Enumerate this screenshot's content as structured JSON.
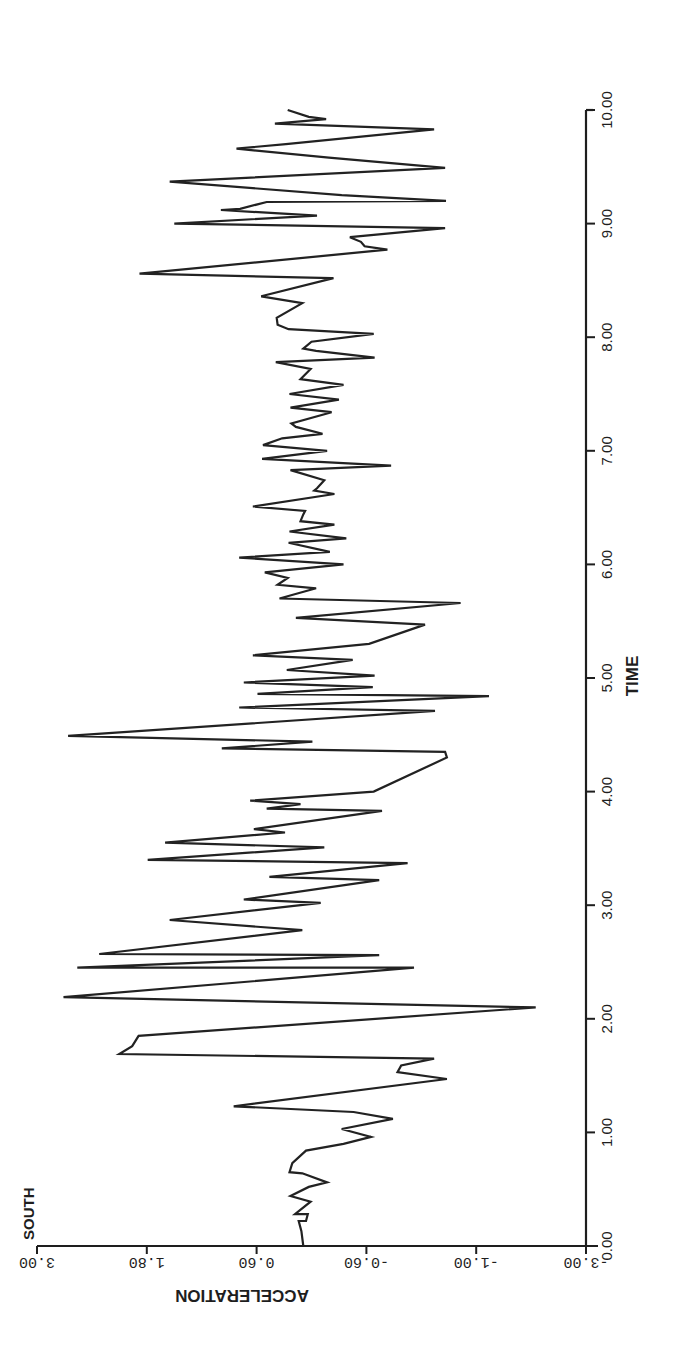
{
  "chart_data": {
    "type": "line",
    "title": "",
    "series_label": "SOUTH",
    "xlabel": "TIME",
    "ylabel": "ACCELERATION",
    "xlim": [
      0,
      10
    ],
    "ylim": [
      -3,
      3
    ],
    "x_ticks": [
      "0.00",
      "1.00",
      "2.00",
      "3.00",
      "4.00",
      "5.00",
      "6.00",
      "7.00",
      "8.00",
      "9.00",
      "10.00"
    ],
    "y_ticks": [
      "3.00",
      "1.80",
      "0.60",
      "-0.60",
      "-1.00",
      "-3.00"
    ],
    "y_tick_positions": [
      3.0,
      1.8,
      0.6,
      -0.6,
      -1.8,
      -3.0
    ],
    "grid": false,
    "legend": "none",
    "orientation_note": "figure printed rotated 90 degrees; time axis vertical on right, acceleration axis horizontal at bottom",
    "series": [
      {
        "name": "SOUTH",
        "color": "#222222",
        "points": [
          [
            0.0,
            0.09
          ],
          [
            0.13,
            0.11
          ],
          [
            0.22,
            0.14
          ],
          [
            0.22,
            0.06
          ],
          [
            0.28,
            0.04
          ],
          [
            0.28,
            0.18
          ],
          [
            0.39,
            0.01
          ],
          [
            0.44,
            0.23
          ],
          [
            0.52,
            0.03
          ],
          [
            0.56,
            -0.17
          ],
          [
            0.64,
            0.1
          ],
          [
            0.65,
            0.24
          ],
          [
            0.73,
            0.21
          ],
          [
            0.84,
            0.06
          ],
          [
            0.9,
            -0.35
          ],
          [
            0.96,
            -0.65
          ],
          [
            1.03,
            -0.33
          ],
          [
            1.12,
            -0.89
          ],
          [
            1.18,
            -0.46
          ],
          [
            1.23,
            0.85
          ],
          [
            1.47,
            -1.48
          ],
          [
            1.53,
            -0.94
          ],
          [
            1.59,
            -0.98
          ],
          [
            1.65,
            -1.34
          ],
          [
            1.69,
            2.1
          ],
          [
            1.76,
            1.96
          ],
          [
            1.85,
            1.89
          ],
          [
            2.1,
            -2.45
          ],
          [
            2.19,
            2.71
          ],
          [
            2.45,
            -1.12
          ],
          [
            2.45,
            2.56
          ],
          [
            2.56,
            -0.74
          ],
          [
            2.57,
            2.32
          ],
          [
            2.78,
            0.1
          ],
          [
            2.87,
            1.55
          ],
          [
            3.02,
            -0.1
          ],
          [
            3.05,
            0.74
          ],
          [
            3.22,
            -0.74
          ],
          [
            3.25,
            0.46
          ],
          [
            3.37,
            -1.05
          ],
          [
            3.4,
            1.79
          ],
          [
            3.51,
            -0.14
          ],
          [
            3.55,
            1.6
          ],
          [
            3.64,
            0.29
          ],
          [
            3.67,
            0.63
          ],
          [
            3.83,
            -0.77
          ],
          [
            3.85,
            0.49
          ],
          [
            3.87,
            0.3
          ],
          [
            3.89,
            0.12
          ],
          [
            3.92,
            0.67
          ],
          [
            4.0,
            -0.68
          ],
          [
            4.3,
            -1.48
          ],
          [
            4.35,
            -1.46
          ],
          [
            4.38,
            0.98
          ],
          [
            4.44,
            -0.01
          ],
          [
            4.49,
            2.66
          ],
          [
            4.71,
            -1.35
          ],
          [
            4.74,
            0.79
          ],
          [
            4.84,
            -1.94
          ],
          [
            4.86,
            0.59
          ],
          [
            4.92,
            -0.67
          ],
          [
            4.96,
            0.74
          ],
          [
            5.02,
            -0.69
          ],
          [
            5.07,
            0.27
          ],
          [
            5.16,
            -0.45
          ],
          [
            5.2,
            0.64
          ],
          [
            5.3,
            -0.63
          ],
          [
            5.47,
            -1.24
          ],
          [
            5.53,
            0.17
          ],
          [
            5.66,
            -1.63
          ],
          [
            5.7,
            0.35
          ],
          [
            5.79,
            -0.05
          ],
          [
            5.82,
            0.37
          ],
          [
            5.88,
            0.26
          ],
          [
            5.93,
            0.51
          ],
          [
            6.0,
            -0.35
          ],
          [
            6.06,
            0.79
          ],
          [
            6.11,
            -0.2
          ],
          [
            6.19,
            0.25
          ],
          [
            6.23,
            -0.38
          ],
          [
            6.29,
            0.24
          ],
          [
            6.35,
            -0.25
          ],
          [
            6.38,
            0.12
          ],
          [
            6.44,
            0.09
          ],
          [
            6.47,
            0.07
          ],
          [
            6.51,
            0.64
          ],
          [
            6.62,
            -0.25
          ],
          [
            6.65,
            -0.03
          ],
          [
            6.67,
            -0.06
          ],
          [
            6.74,
            -0.14
          ],
          [
            6.83,
            0.23
          ],
          [
            6.87,
            -0.87
          ],
          [
            6.93,
            0.54
          ],
          [
            7.0,
            -0.17
          ],
          [
            7.05,
            0.53
          ],
          [
            7.11,
            0.32
          ],
          [
            7.15,
            -0.12
          ],
          [
            7.21,
            0.17
          ],
          [
            7.24,
            0.22
          ],
          [
            7.34,
            -0.22
          ],
          [
            7.38,
            0.23
          ],
          [
            7.45,
            -0.3
          ],
          [
            7.5,
            0.24
          ],
          [
            7.58,
            -0.35
          ],
          [
            7.63,
            0.12
          ],
          [
            7.72,
            0.01
          ],
          [
            7.78,
            0.39
          ],
          [
            7.82,
            -0.69
          ],
          [
            7.88,
            -0.05
          ],
          [
            7.9,
            0.09
          ],
          [
            7.96,
            0.0
          ],
          [
            8.03,
            -0.68
          ],
          [
            8.07,
            0.25
          ],
          [
            8.11,
            0.37
          ],
          [
            8.17,
            0.38
          ],
          [
            8.3,
            0.1
          ],
          [
            8.36,
            0.55
          ],
          [
            8.52,
            -0.24
          ],
          [
            8.52,
            -0.22
          ],
          [
            8.56,
            1.88
          ],
          [
            8.77,
            -0.83
          ],
          [
            8.8,
            -0.58
          ],
          [
            8.84,
            -0.54
          ],
          [
            8.88,
            -0.42
          ],
          [
            8.96,
            -1.46
          ],
          [
            9.0,
            1.5
          ],
          [
            9.07,
            -0.06
          ],
          [
            9.12,
            0.99
          ],
          [
            9.13,
            0.78
          ],
          [
            9.19,
            0.49
          ],
          [
            9.2,
            -1.47
          ],
          [
            9.25,
            -0.33
          ],
          [
            9.37,
            1.55
          ],
          [
            9.49,
            -1.46
          ],
          [
            9.58,
            -0.19
          ],
          [
            9.66,
            0.82
          ],
          [
            9.7,
            0.28
          ],
          [
            9.83,
            -1.34
          ],
          [
            9.88,
            0.4
          ],
          [
            9.92,
            -0.16
          ],
          [
            9.94,
            0.03
          ],
          [
            10.0,
            0.26
          ]
        ]
      }
    ]
  }
}
